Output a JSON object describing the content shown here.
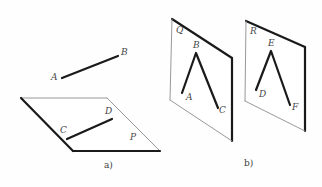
{
  "figure": {
    "canvas": {
      "width": 322,
      "height": 187,
      "background": "#fefefe"
    },
    "colors": {
      "thick_stroke": "#1a1a1a",
      "thin_stroke": "#8c8c8c",
      "label_text": "#4a4a4a",
      "caption_text": "#3d3d3d"
    },
    "panels": [
      {
        "id": "panel-a",
        "caption": "a)",
        "caption_pos": {
          "x": 104,
          "y": 160
        },
        "plane": {
          "name": "P",
          "label": "P",
          "label_pos": {
            "x": 130,
            "y": 133
          },
          "vertices": [
            {
              "x": 21,
              "y": 98
            },
            {
              "x": 107,
              "y": 98
            },
            {
              "x": 160,
              "y": 151
            },
            {
              "x": 73,
              "y": 151
            }
          ],
          "edges": [
            {
              "from": 0,
              "to": 1,
              "weight": "thin"
            },
            {
              "from": 1,
              "to": 2,
              "weight": "thin"
            },
            {
              "from": 2,
              "to": 3,
              "weight": "thick"
            },
            {
              "from": 3,
              "to": 0,
              "weight": "thick"
            }
          ]
        },
        "segments": [
          {
            "name": "AB",
            "weight": "thick",
            "from": {
              "x": 62,
              "y": 78
            },
            "to": {
              "x": 118,
              "y": 56
            },
            "endpoints": [
              {
                "label": "A",
                "x": 51,
                "y": 73
              },
              {
                "label": "B",
                "x": 121,
                "y": 48
              }
            ]
          },
          {
            "name": "CD",
            "weight": "thick",
            "from": {
              "x": 67,
              "y": 139
            },
            "to": {
              "x": 112,
              "y": 119
            },
            "endpoints": [
              {
                "label": "C",
                "x": 60,
                "y": 126
              },
              {
                "label": "D",
                "x": 105,
                "y": 107
              }
            ]
          }
        ]
      },
      {
        "id": "panel-b",
        "caption": "b)",
        "caption_pos": {
          "x": 244,
          "y": 158
        },
        "planes": [
          {
            "name": "Q",
            "label": "Q",
            "label_pos": {
              "x": 176,
              "y": 26
            },
            "vertices": [
              {
                "x": 172,
                "y": 19
              },
              {
                "x": 232,
                "y": 58
              },
              {
                "x": 232,
                "y": 141
              },
              {
                "x": 170,
                "y": 100
              }
            ],
            "edges": [
              {
                "from": 0,
                "to": 1,
                "weight": "thick"
              },
              {
                "from": 1,
                "to": 2,
                "weight": "thick"
              },
              {
                "from": 2,
                "to": 3,
                "weight": "thin"
              },
              {
                "from": 3,
                "to": 0,
                "weight": "thin"
              }
            ],
            "polyline": {
              "name": "ABC",
              "weight": "thick",
              "points": [
                {
                  "x": 182,
                  "y": 93
                },
                {
                  "x": 196,
                  "y": 53
                },
                {
                  "x": 218,
                  "y": 108
                }
              ],
              "labels": [
                {
                  "label": "A",
                  "x": 186,
                  "y": 93
                },
                {
                  "label": "B",
                  "x": 193,
                  "y": 41
                },
                {
                  "label": "C",
                  "x": 219,
                  "y": 106
                }
              ]
            }
          },
          {
            "name": "R",
            "label": "R",
            "label_pos": {
              "x": 250,
              "y": 27
            },
            "vertices": [
              {
                "x": 246,
                "y": 21
              },
              {
                "x": 305,
                "y": 47
              },
              {
                "x": 305,
                "y": 131
              },
              {
                "x": 245,
                "y": 101
              }
            ],
            "edges": [
              {
                "from": 0,
                "to": 1,
                "weight": "thick"
              },
              {
                "from": 1,
                "to": 2,
                "weight": "thick"
              },
              {
                "from": 2,
                "to": 3,
                "weight": "thin"
              },
              {
                "from": 3,
                "to": 0,
                "weight": "thin"
              }
            ],
            "polyline": {
              "name": "DEF",
              "weight": "thick",
              "points": [
                {
                  "x": 256,
                  "y": 90
                },
                {
                  "x": 271,
                  "y": 51
                },
                {
                  "x": 290,
                  "y": 105
                }
              ],
              "labels": [
                {
                  "label": "D",
                  "x": 259,
                  "y": 90
                },
                {
                  "label": "E",
                  "x": 268,
                  "y": 39
                },
                {
                  "label": "F",
                  "x": 292,
                  "y": 103
                }
              ]
            }
          }
        ]
      }
    ]
  }
}
